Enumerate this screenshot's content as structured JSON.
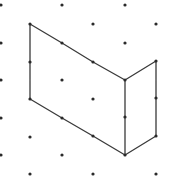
{
  "diagram": {
    "type": "isometric-dot-grid-figure",
    "background": "#ffffff",
    "dot_color": "#2a2a2a",
    "line_color": "#3a3a3a",
    "grid": {
      "columns_x": [
        1,
        30,
        62,
        93,
        125,
        156
      ],
      "even_column_rows_y": [
        24,
        62,
        99,
        137,
        174
      ],
      "odd_column_rows_y": [
        5,
        43,
        80,
        118,
        155
      ]
    },
    "dots": [
      [
        1,
        5
      ],
      [
        1,
        43
      ],
      [
        1,
        80
      ],
      [
        1,
        118
      ],
      [
        1,
        155
      ],
      [
        30,
        24
      ],
      [
        30,
        62
      ],
      [
        30,
        99
      ],
      [
        30,
        137
      ],
      [
        30,
        174
      ],
      [
        62,
        5
      ],
      [
        62,
        43
      ],
      [
        62,
        80
      ],
      [
        62,
        118
      ],
      [
        62,
        155
      ],
      [
        93,
        24
      ],
      [
        93,
        62
      ],
      [
        93,
        99
      ],
      [
        93,
        136
      ],
      [
        93,
        174
      ],
      [
        125,
        5
      ],
      [
        125,
        43
      ],
      [
        125,
        80
      ],
      [
        125,
        117
      ],
      [
        125,
        155
      ],
      [
        156,
        24
      ],
      [
        156,
        61
      ],
      [
        156,
        98
      ],
      [
        156,
        136
      ],
      [
        156,
        174
      ]
    ],
    "outline": [
      [
        30,
        24
      ],
      [
        62,
        43
      ],
      [
        93,
        62
      ],
      [
        125,
        80
      ],
      [
        156,
        61
      ],
      [
        156,
        98
      ],
      [
        156,
        136
      ],
      [
        125,
        155
      ],
      [
        93,
        136
      ],
      [
        62,
        118
      ],
      [
        30,
        99
      ],
      [
        30,
        62
      ],
      [
        30,
        24
      ]
    ],
    "inner_edges": [
      [
        [
          125,
          80
        ],
        [
          125,
          155
        ]
      ]
    ],
    "faces": [
      {
        "name": "left-face",
        "points": [
          [
            30,
            24
          ],
          [
            125,
            80
          ],
          [
            125,
            155
          ],
          [
            30,
            99
          ]
        ]
      },
      {
        "name": "right-face",
        "points": [
          [
            125,
            80
          ],
          [
            156,
            61
          ],
          [
            156,
            136
          ],
          [
            125,
            155
          ]
        ]
      }
    ]
  }
}
